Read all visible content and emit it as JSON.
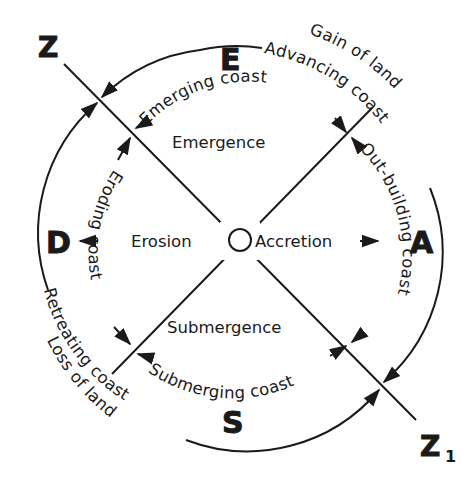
{
  "diagram": {
    "type": "coastal classification circle",
    "axis_labels": {
      "top": "E",
      "bottom": "S",
      "left": "D",
      "right": "A",
      "z_start": "Z",
      "z_end": "Z",
      "z_end_subscript": "1"
    },
    "center_labels": {
      "left": "Erosion",
      "right": "Accretion",
      "top": "Emergence",
      "bottom": "Submergence"
    },
    "inner_arc_labels": {
      "top": "Emerging coast",
      "right": "Out-building coast",
      "bottom": "Submerging coast",
      "left": "Eroding coast"
    },
    "outer_arc_labels": {
      "top_right_inner": "Advancing coast",
      "top_right_outer": "Gain of land",
      "bottom_left_inner": "Retreating coast",
      "bottom_left_outer": "Loss of land"
    },
    "colors": {
      "ink": "#1a1a1a",
      "background": "#ffffff"
    }
  }
}
